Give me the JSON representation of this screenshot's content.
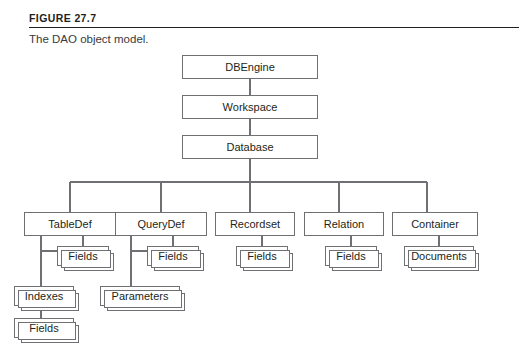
{
  "figure": {
    "label": "FIGURE 27.7",
    "caption": "The DAO object model."
  },
  "diagram": {
    "type": "hierarchy-tree",
    "title": "The DAO object model.",
    "nodes": {
      "dbengine": {
        "label": "DBEngine",
        "level": 0,
        "kind": "single"
      },
      "workspace": {
        "label": "Workspace",
        "level": 1,
        "kind": "single"
      },
      "database": {
        "label": "Database",
        "level": 2,
        "kind": "single"
      },
      "tabledef": {
        "label": "TableDef",
        "level": 3,
        "kind": "single"
      },
      "querydef": {
        "label": "QueryDef",
        "level": 3,
        "kind": "single"
      },
      "recordset": {
        "label": "Recordset",
        "level": 3,
        "kind": "single"
      },
      "relation": {
        "label": "Relation",
        "level": 3,
        "kind": "single"
      },
      "container": {
        "label": "Container",
        "level": 3,
        "kind": "single"
      },
      "tabledef_fields": {
        "label": "Fields",
        "level": 4,
        "kind": "stack"
      },
      "querydef_fields": {
        "label": "Fields",
        "level": 4,
        "kind": "stack"
      },
      "recordset_fields": {
        "label": "Fields",
        "level": 4,
        "kind": "stack"
      },
      "relation_fields": {
        "label": "Fields",
        "level": 4,
        "kind": "stack"
      },
      "container_documents": {
        "label": "Documents",
        "level": 4,
        "kind": "stack"
      },
      "tabledef_indexes": {
        "label": "Indexes",
        "level": 5,
        "kind": "stack"
      },
      "querydef_parameters": {
        "label": "Parameters",
        "level": 5,
        "kind": "stack"
      },
      "indexes_fields": {
        "label": "Fields",
        "level": 6,
        "kind": "stack"
      }
    },
    "edges": [
      [
        "dbengine",
        "workspace"
      ],
      [
        "workspace",
        "database"
      ],
      [
        "database",
        "tabledef"
      ],
      [
        "database",
        "querydef"
      ],
      [
        "database",
        "recordset"
      ],
      [
        "database",
        "relation"
      ],
      [
        "database",
        "container"
      ],
      [
        "tabledef",
        "tabledef_fields"
      ],
      [
        "querydef",
        "querydef_fields"
      ],
      [
        "recordset",
        "recordset_fields"
      ],
      [
        "relation",
        "relation_fields"
      ],
      [
        "container",
        "container_documents"
      ],
      [
        "tabledef",
        "tabledef_indexes"
      ],
      [
        "querydef",
        "querydef_parameters"
      ],
      [
        "tabledef_indexes",
        "indexes_fields"
      ]
    ],
    "colors": {
      "box_stroke": "#6f7073",
      "box_fill": "#ffffff",
      "text": "#231f20",
      "rule": "#231f20",
      "caption_text": "#3a3a3c"
    }
  }
}
